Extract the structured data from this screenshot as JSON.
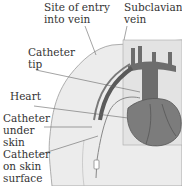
{
  "diagram": {
    "type": "anatomical-illustration",
    "labels": [
      {
        "id": "site-of-entry",
        "text": "Site of entry\ninto vein"
      },
      {
        "id": "subclavian-vein",
        "text": "Subclavian\nvein"
      },
      {
        "id": "catheter-tip",
        "text": "Catheter\ntip"
      },
      {
        "id": "heart",
        "text": "Heart"
      },
      {
        "id": "catheter-under-skin",
        "text": "Catheter\nunder\nskin"
      },
      {
        "id": "catheter-on-skin",
        "text": "Catheter\non skin\nsurface"
      }
    ]
  }
}
